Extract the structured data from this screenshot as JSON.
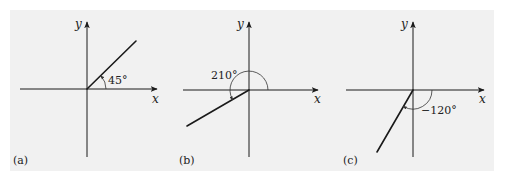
{
  "figure": {
    "background_color": "#f1f1f1",
    "line_color": "#1a1a1a",
    "panels": [
      {
        "id": "a",
        "label": "(a)",
        "x_axis_label": "x",
        "y_axis_label": "y",
        "angle_degrees": 45,
        "angle_label": "45°",
        "direction": "counterclockwise"
      },
      {
        "id": "b",
        "label": "(b)",
        "x_axis_label": "x",
        "y_axis_label": "y",
        "angle_degrees": 210,
        "angle_label": "210°",
        "direction": "counterclockwise"
      },
      {
        "id": "c",
        "label": "(c)",
        "x_axis_label": "x",
        "y_axis_label": "y",
        "angle_degrees": -120,
        "angle_label": "−120°",
        "direction": "clockwise"
      }
    ]
  }
}
